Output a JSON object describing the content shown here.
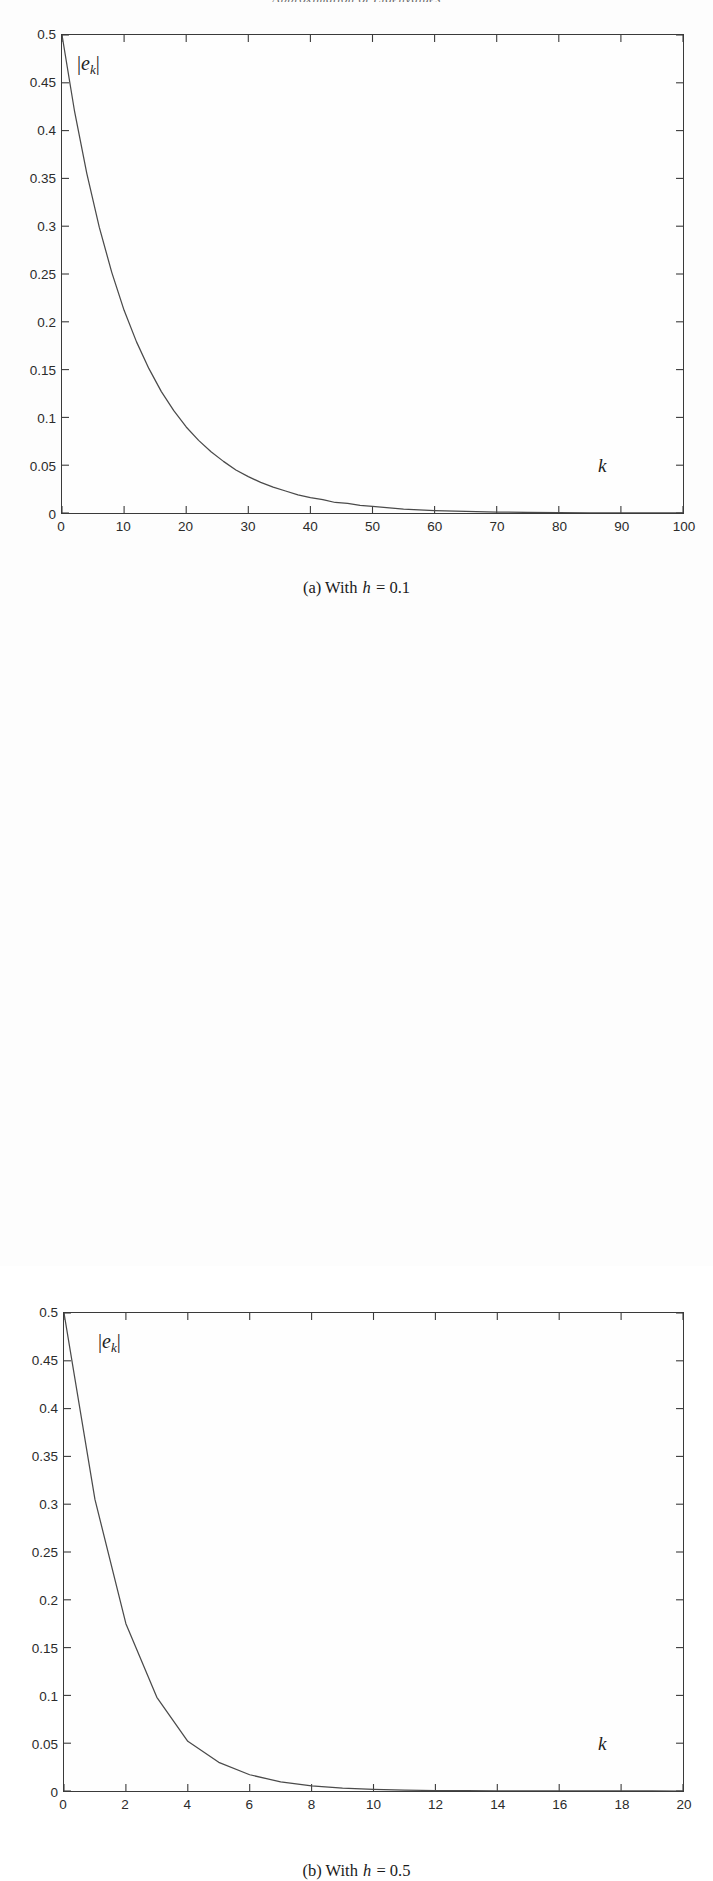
{
  "page": {
    "running_head": "Approximation of Eigenvalues",
    "background_color": "#fdfdfd",
    "ink_color": "#2b2b2b"
  },
  "figures": [
    {
      "id": "a",
      "caption_prefix": "(a) With",
      "caption_symbol": "h",
      "caption_equals": "= 0.1",
      "y_axis_label_abs_open": "|",
      "y_axis_label_sym": "e",
      "y_axis_label_sub": "k",
      "y_axis_label_abs_close": "|",
      "x_axis_label": "k"
    },
    {
      "id": "b",
      "caption_prefix": "(b) With",
      "caption_symbol": "h",
      "caption_equals": "= 0.5",
      "y_axis_label_abs_open": "|",
      "y_axis_label_sym": "e",
      "y_axis_label_sub": "k",
      "y_axis_label_abs_close": "|",
      "x_axis_label": "k"
    }
  ],
  "chart_data": [
    {
      "type": "line",
      "id": "error-decay-h-0p1",
      "title": "",
      "subtitle": "(a) With h = 0.1",
      "xlabel": "k",
      "ylabel": "|e_k|",
      "xlim": [
        0,
        100
      ],
      "ylim": [
        0,
        0.5
      ],
      "xticks": [
        0,
        10,
        20,
        30,
        40,
        50,
        60,
        70,
        80,
        90,
        100
      ],
      "xticklabels": [
        "0",
        "10",
        "20",
        "30",
        "40",
        "50",
        "60",
        "70",
        "80",
        "90",
        "100"
      ],
      "yticks": [
        0,
        0.05,
        0.1,
        0.15,
        0.2,
        0.25,
        0.3,
        0.35,
        0.4,
        0.45,
        0.5
      ],
      "yticklabels": [
        "0",
        "0.05",
        "0.1",
        "0.15",
        "0.2",
        "0.25",
        "0.3",
        "0.35",
        "0.4",
        "0.45",
        "0.5"
      ],
      "grid": false,
      "legend": null,
      "line_color": "#4a4a4a",
      "series": [
        {
          "name": "|e_k|",
          "x": [
            0,
            2,
            4,
            6,
            8,
            10,
            12,
            14,
            16,
            18,
            20,
            22,
            24,
            26,
            28,
            30,
            32,
            34,
            36,
            38,
            40,
            42,
            44,
            46,
            48,
            50,
            55,
            60,
            65,
            70,
            75,
            80,
            85,
            90,
            95,
            100
          ],
          "values": [
            0.5,
            0.421,
            0.355,
            0.299,
            0.252,
            0.212,
            0.179,
            0.151,
            0.127,
            0.107,
            0.09,
            0.076,
            0.064,
            0.054,
            0.045,
            0.038,
            0.032,
            0.027,
            0.023,
            0.019,
            0.016,
            0.014,
            0.011,
            0.01,
            0.008,
            0.007,
            0.004,
            0.0026,
            0.0016,
            0.001,
            0.0006,
            0.0004,
            0.0002,
            0.00014,
            9e-05,
            5e-05
          ]
        }
      ]
    },
    {
      "type": "line",
      "id": "error-decay-h-0p5",
      "title": "",
      "subtitle": "(b) With h = 0.5",
      "xlabel": "k",
      "ylabel": "|e_k|",
      "xlim": [
        0,
        20
      ],
      "ylim": [
        0,
        0.5
      ],
      "xticks": [
        0,
        2,
        4,
        6,
        8,
        10,
        12,
        14,
        16,
        18,
        20
      ],
      "xticklabels": [
        "0",
        "2",
        "4",
        "6",
        "8",
        "10",
        "12",
        "14",
        "16",
        "18",
        "20"
      ],
      "yticks": [
        0,
        0.05,
        0.1,
        0.15,
        0.2,
        0.25,
        0.3,
        0.35,
        0.4,
        0.45,
        0.5
      ],
      "yticklabels": [
        "0",
        "0.05",
        "0.1",
        "0.15",
        "0.2",
        "0.25",
        "0.3",
        "0.35",
        "0.4",
        "0.45",
        "0.5"
      ],
      "grid": false,
      "legend": null,
      "line_color": "#4a4a4a",
      "series": [
        {
          "name": "|e_k|",
          "x": [
            0,
            1,
            2,
            3,
            4,
            5,
            6,
            7,
            8,
            9,
            10,
            11,
            12,
            13,
            14,
            15,
            16,
            17,
            18,
            19,
            20
          ],
          "values": [
            0.5,
            0.305,
            0.175,
            0.098,
            0.052,
            0.03,
            0.017,
            0.0095,
            0.0053,
            0.003,
            0.0017,
            0.0009,
            0.0005,
            0.0003,
            0.00017,
            0.0001,
            5e-05,
            3e-05,
            2e-05,
            1e-05,
            5e-06
          ]
        }
      ]
    }
  ]
}
